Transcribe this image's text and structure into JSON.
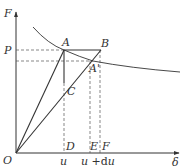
{
  "diagram": {
    "type": "force-displacement diagram",
    "axes": {
      "y_label": "F",
      "x_label": "δ",
      "origin_label": "O"
    },
    "levels": {
      "P_label": "P"
    },
    "points": {
      "A": "A",
      "B": "B",
      "A_prime": "A'",
      "C": "C",
      "D": "D",
      "E": "E",
      "F": "F"
    },
    "x_ticks": {
      "u": "u",
      "u_du_prefix": "u +",
      "u_du_d": "d",
      "u_du_u": "u"
    },
    "colors": {
      "line": "#333333",
      "dashed": "#555555",
      "background": "#ffffff"
    }
  }
}
